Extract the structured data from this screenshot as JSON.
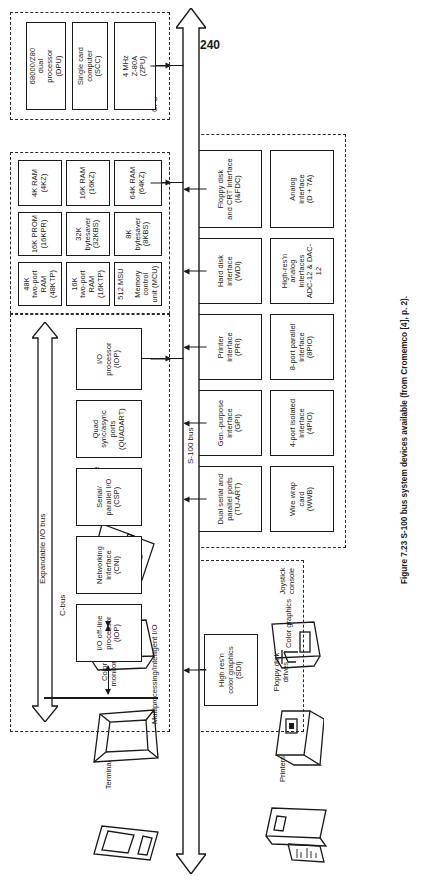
{
  "page": {
    "number": "240",
    "caption": "Figure 7.23 S-100 bus system devices available (from Cromemco [4], p. 2)."
  },
  "peripherals": [
    {
      "id": "printers",
      "label": "Printers"
    },
    {
      "id": "terminal",
      "label": "Terminal"
    },
    {
      "id": "floppy-drives",
      "label": "Floppy disk\ndrives"
    },
    {
      "id": "color-monitors",
      "label": "Color\nmonitors"
    },
    {
      "id": "joystick",
      "label": "Joystick\nconsole"
    },
    {
      "id": "band-disk",
      "label": "11-mbyte\nband disk\ndrive"
    },
    {
      "id": "software",
      "label": "Extensive\nsoftware\nsupport"
    }
  ],
  "buses": {
    "s100": "S-100 bus",
    "cbus": "C-bus",
    "expandable": "Expandable I/O bus"
  },
  "groups": {
    "multiprocessing": {
      "title": "Multiprocessing/Intelligent I/O",
      "boxes": [
        {
          "label": "I/O off-line\nprocessor\n(IOP)"
        },
        {
          "label": "Networking\ninterface\n(CNI)"
        },
        {
          "label": "Serial/\nparallel I/O\n(CSP)"
        },
        {
          "label": "Quad\nsync/async\nports\n(QUADART)"
        },
        {
          "label": "I/O\nprocessor\n(IOP)"
        }
      ]
    },
    "memory": {
      "title": "Memory",
      "rows": [
        [
          {
            "label": "48K\ntwo-port\nRAM\n(48KTP)"
          },
          {
            "label": "16K\ntwo-port\nRAM\n(16KTP)"
          },
          {
            "label": "512 MSU\n\nMemory\ncontrol\nunit (MCU)"
          }
        ],
        [
          {
            "label": "16K PROM\n(16KPR)"
          },
          {
            "label": "32K\nbytesaver\n(32KBS)"
          },
          {
            "label": "8K\nbytesaver\n(8KBS)"
          }
        ],
        [
          {
            "label": "4K RAM\n(4KZ)"
          },
          {
            "label": "16K RAM\n(16KZ)"
          },
          {
            "label": "64K RAM\n(64KZ)"
          }
        ]
      ]
    },
    "cpu": {
      "title": "CPU",
      "boxes": [
        {
          "label": "68000/Z80\ndual\nprocessor\n(DPU)"
        },
        {
          "label": "Single card\ncomputer\n(SCC)"
        },
        {
          "label": "4 MHz\nZ-80A\n(ZPU)"
        }
      ]
    },
    "color_graphics": {
      "title": "Color graphics",
      "boxes": [
        {
          "label": "High res'n\ncolor graphics\n(SDI)"
        }
      ]
    },
    "io_interfaces": {
      "title": "I/O interfaces",
      "rows": [
        [
          {
            "label": "Dual serial and\nparallel ports\n(TU-ART)"
          },
          {
            "label": "Gen.-purpose\ninterface\n(GPI)"
          },
          {
            "label": "Printer\ninterface\n(PRI)"
          },
          {
            "label": "Hard disk\ninterface\n(WDI)"
          },
          {
            "label": "Floppy disk\nand CRT interface\n(I&FDC)"
          }
        ],
        [
          {
            "label": "Wire wrap\ncard\n(WWB)"
          },
          {
            "label": "4-port isolated\ninterface\n(4PIO)"
          },
          {
            "label": "8-port parallel\ninterface\n(8PIO)"
          },
          {
            "label": "High-res'n\nanalog\ninterfaces\nADC-12 & DAC-12"
          },
          {
            "label": "Analog\ninterface\n(D + 7A)"
          }
        ]
      ]
    }
  },
  "colors": {
    "ink": "#1a1a1a",
    "paper": "#ffffff"
  }
}
